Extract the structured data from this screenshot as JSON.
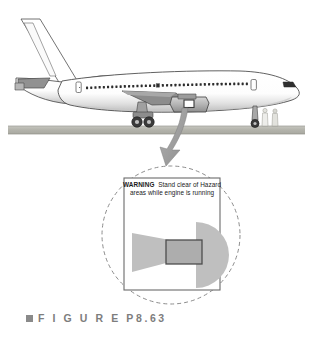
{
  "figure": {
    "caption_marker": "square-bullet",
    "caption_text": "F I G U R E   P8.63",
    "background_color": "#ffffff"
  },
  "scene": {
    "name": "airliner-on-tarmac-with-engine-hazard-placard",
    "ground": {
      "label": "tarmac-ground-band",
      "color": "#b9b9b1",
      "top_y": 126,
      "height": 8
    },
    "aircraft": {
      "label": "commercial-jet-airliner-side-view",
      "fuselage_color": "#fbfbfb",
      "outline_color": "#4a4a4a",
      "shadow_color": "#c9c9c9",
      "window_color": "#2e2e2e",
      "window_count": 38,
      "parts": [
        "vertical-stabilizer",
        "horizontal-stabilizer",
        "fuselage",
        "cockpit-windshield",
        "passenger-windows",
        "forward-door",
        "aft-door",
        "wing",
        "engine-nacelle",
        "main-landing-gear",
        "nose-landing-gear"
      ]
    },
    "ground_crew": {
      "label": "ground-crew-figures",
      "count": 2,
      "color": "#d8d8d2"
    },
    "callout_arrow": {
      "label": "curved-callout-arrow",
      "color": "#9a9a9a",
      "from": "engine-nacelle-placard",
      "to": "detail-circle"
    },
    "detail_circle": {
      "label": "dashed-detail-circle",
      "stroke_color": "#8c8c8c",
      "dash": "4 3",
      "center_x": 171,
      "center_y": 235,
      "radius": 69
    }
  },
  "placard": {
    "name": "engine-hazard-warning-placard",
    "border_color": "#6b6b6b",
    "background": "#ffffff",
    "box": {
      "x": 124,
      "y": 178,
      "width": 96,
      "height": 112
    },
    "warning_word": "WARNING",
    "warning_body": "Stand clear of Hazard areas while engine is running",
    "lines": [
      "WARNING   Stand clear of",
      "Hazard areas while engine is",
      "running"
    ],
    "diagram": {
      "label": "engine-hazard-zone-diagram",
      "hazard_zone_color": "#bdbdbd",
      "engine_body_color": "#ababab",
      "engine_outline_color": "#4d4d4d",
      "shapes": [
        {
          "name": "intake-hazard-cone",
          "type": "trapezoid",
          "side": "left"
        },
        {
          "name": "engine-body",
          "type": "rectangle",
          "side": "center"
        },
        {
          "name": "exhaust-hazard-fan",
          "type": "half-circle",
          "side": "right"
        }
      ]
    }
  }
}
